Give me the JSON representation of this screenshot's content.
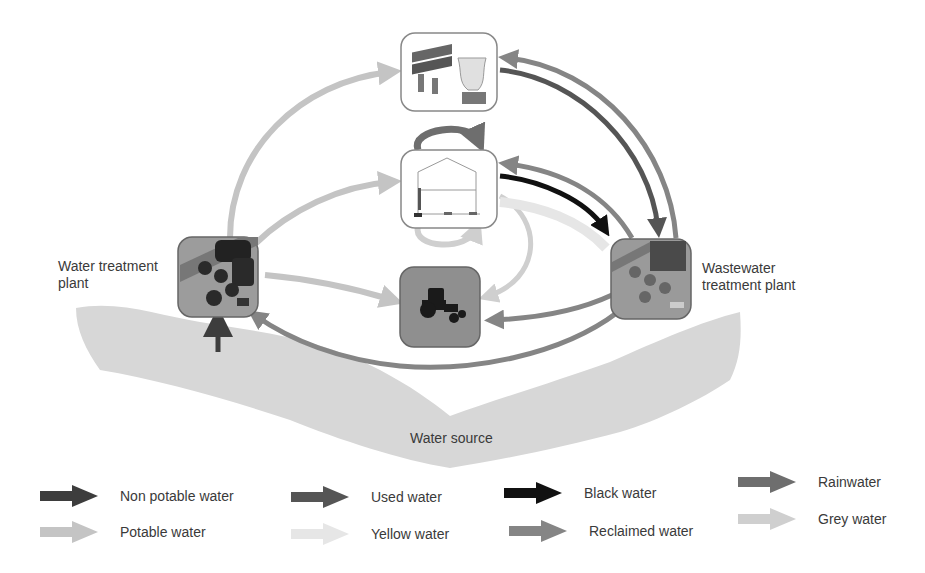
{
  "diagram": {
    "nodes": {
      "water_treatment_plant": {
        "label_line1": "Water treatment",
        "label_line2": "plant"
      },
      "wastewater_treatment_plant": {
        "label_line1": "Wastewater",
        "label_line2": "treatment plant"
      },
      "industry": {
        "icon": "industrial-plant-icon"
      },
      "household": {
        "icon": "house-icon"
      },
      "agriculture": {
        "icon": "tractor-icon"
      },
      "water_source": {
        "label": "Water source"
      }
    },
    "edges": [
      {
        "from": "water_source",
        "to": "water_treatment_plant",
        "type": "Non potable water"
      },
      {
        "from": "water_treatment_plant",
        "to": "industry",
        "type": "Potable water"
      },
      {
        "from": "water_treatment_plant",
        "to": "household",
        "type": "Potable water"
      },
      {
        "from": "water_treatment_plant",
        "to": "agriculture",
        "type": "Potable water"
      },
      {
        "from": "household",
        "to": "household",
        "type": "Rainwater"
      },
      {
        "from": "household",
        "to": "household",
        "type": "Grey water"
      },
      {
        "from": "household",
        "to": "agriculture",
        "type": "Grey water"
      },
      {
        "from": "household",
        "to": "wastewater_treatment_plant",
        "type": "Black water"
      },
      {
        "from": "household",
        "to": "wastewater_treatment_plant",
        "type": "Yellow water"
      },
      {
        "from": "industry",
        "to": "wastewater_treatment_plant",
        "type": "Used water"
      },
      {
        "from": "wastewater_treatment_plant",
        "to": "industry",
        "type": "Reclaimed water"
      },
      {
        "from": "wastewater_treatment_plant",
        "to": "household",
        "type": "Reclaimed water"
      },
      {
        "from": "wastewater_treatment_plant",
        "to": "agriculture",
        "type": "Reclaimed water"
      },
      {
        "from": "wastewater_treatment_plant",
        "to": "water_treatment_plant",
        "type": "Reclaimed water"
      }
    ]
  },
  "legend": {
    "items": [
      {
        "label": "Non potable water",
        "color": "#3d3d3d"
      },
      {
        "label": "Potable water",
        "color": "#c4c4c4"
      },
      {
        "label": "Used water",
        "color": "#555555"
      },
      {
        "label": "Yellow water",
        "color": "#e6e6e6"
      },
      {
        "label": "Black water",
        "color": "#111111"
      },
      {
        "label": "Reclaimed water",
        "color": "#858585"
      },
      {
        "label": "Rainwater",
        "color": "#6e6e6e"
      },
      {
        "label": "Grey water",
        "color": "#cfcfcf"
      }
    ]
  }
}
